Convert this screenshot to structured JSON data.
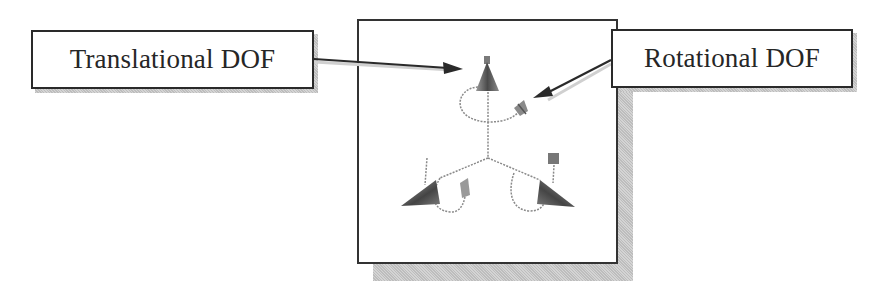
{
  "diagram": {
    "labels": {
      "translational": "Translational DOF",
      "rotational": "Rotational DOF"
    },
    "icons": {
      "translational_marker": "cone-arrow-icon",
      "rotational_marker": "rotation-handle-icon",
      "triad": "dof-triad-icon"
    },
    "colors": {
      "border": "#2a2a2a",
      "shadow": "#c8c8c8",
      "cone_dark": "#4a4a4a",
      "cone_light": "#9a9a9a",
      "dashed_line": "#8a8a8a",
      "text": "#262626"
    }
  }
}
